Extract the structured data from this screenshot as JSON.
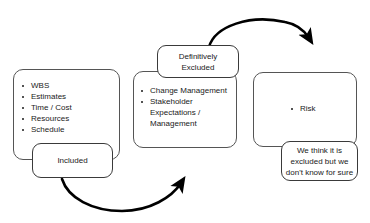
{
  "diagram": {
    "background_color": "#ffffff",
    "outline_color": "#555555",
    "arrow_color": "#000000",
    "text_color": "#1a1a1a"
  },
  "included_group": {
    "items": [
      "WBS",
      "Estimates",
      "Time / Cost",
      "Resources",
      "Schedule"
    ],
    "label": "Included"
  },
  "excluded_group": {
    "items": [
      "Change Management",
      "Stakeholder",
      "Expectations /",
      "Management"
    ],
    "label": "Definitively\nExcluded"
  },
  "risk_group": {
    "items": [
      "Risk"
    ],
    "label": "We think it is\nexcluded but we\ndon't know for sure"
  },
  "arrows": [
    {
      "name": "included-to-excluded",
      "from": "Included",
      "to": "Definitively Excluded",
      "direction": "left-to-right-below"
    },
    {
      "name": "excluded-to-risk",
      "from": "Definitively Excluded",
      "to": "Risk",
      "direction": "left-to-right-above"
    }
  ]
}
